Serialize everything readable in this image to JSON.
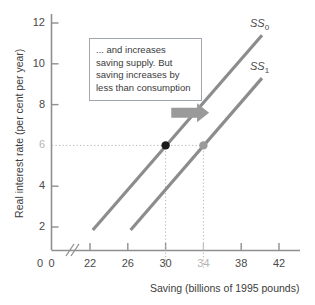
{
  "chart_data": {
    "type": "line",
    "title": "",
    "xlabel": "Saving (billions of 1995 pounds)",
    "ylabel": "Real interest rate (per cent per year)",
    "xlim": [
      20,
      43
    ],
    "ylim": [
      0,
      13
    ],
    "axis_break_x": true,
    "grid": false,
    "legend_position": "inline-right",
    "xticks": [
      {
        "value": 0,
        "label": "0",
        "muted": false
      },
      {
        "value": 22,
        "label": "22",
        "muted": false
      },
      {
        "value": 26,
        "label": "26",
        "muted": false
      },
      {
        "value": 30,
        "label": "30",
        "muted": false
      },
      {
        "value": 34,
        "label": "34",
        "muted": true
      },
      {
        "value": 38,
        "label": "38",
        "muted": false
      },
      {
        "value": 42,
        "label": "42",
        "muted": false
      }
    ],
    "yticks": [
      {
        "value": 12,
        "label": "12",
        "muted": false
      },
      {
        "value": 10,
        "label": "10",
        "muted": false
      },
      {
        "value": 8,
        "label": "8",
        "muted": false
      },
      {
        "value": 6,
        "label": "6",
        "muted": true
      },
      {
        "value": 4,
        "label": "4",
        "muted": false
      },
      {
        "value": 2,
        "label": "2",
        "muted": false
      }
    ],
    "series": [
      {
        "name": "SS0",
        "label": "SS",
        "sublabel": "0",
        "color": "#8c8c8c",
        "points": [
          [
            22.3,
            1.85
          ],
          [
            40.2,
            11.4
          ]
        ]
      },
      {
        "name": "SS1",
        "label": "SS",
        "sublabel": "1",
        "color": "#8c8c8c",
        "points": [
          [
            26.3,
            1.85
          ],
          [
            40.2,
            9.3
          ]
        ]
      }
    ],
    "markers": [
      {
        "name": "equilibrium-initial",
        "x": 30,
        "y": 6,
        "color": "#1a1a1a",
        "radius": 4.2
      },
      {
        "name": "equilibrium-new",
        "x": 34,
        "y": 6,
        "color": "#9a9a9a",
        "radius": 4.2
      }
    ],
    "guide_lines": [
      {
        "name": "interest-rate-guide",
        "orientation": "horizontal",
        "value": 6,
        "from": 20,
        "to": 34
      },
      {
        "name": "saving-30-guide",
        "orientation": "vertical",
        "value": 30,
        "from": 0,
        "to": 6
      },
      {
        "name": "saving-34-guide",
        "orientation": "vertical",
        "value": 34,
        "from": 0,
        "to": 6
      }
    ],
    "annotations": [
      {
        "name": "shift-arrow",
        "type": "arrow",
        "direction": "right",
        "color": "#9a9a9a",
        "from_x": 30.6,
        "to_x": 34.6,
        "y": 7.6
      }
    ]
  },
  "annotation": {
    "text": "... and increases saving supply. But saving increases by less than consumption"
  },
  "colors": {
    "axis": "#8f8f8f",
    "curve": "#8c8c8c",
    "marker_primary": "#1a1a1a",
    "marker_secondary": "#9a9a9a",
    "arrow": "#9a9a9a",
    "text": "#3a3a3a",
    "muted_text": "#b4b4b4",
    "box_border": "#9fa6ad",
    "background": "#ffffff"
  }
}
